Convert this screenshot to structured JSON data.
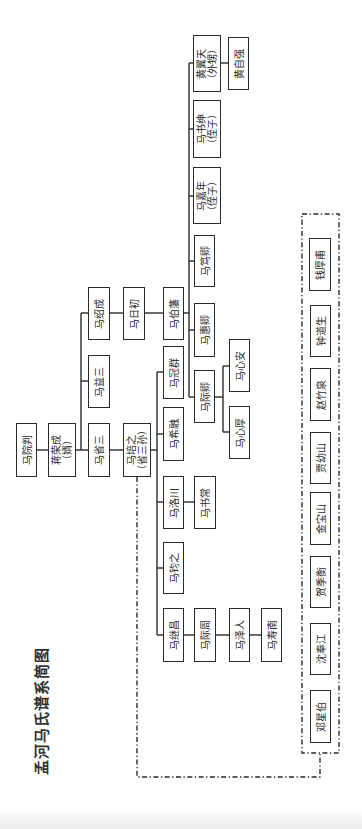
{
  "title": "孟河马氏谱系简图",
  "colors": {
    "line": "#2a2a2a",
    "text": "#2a2a2a",
    "background": "#ffffff"
  },
  "nodes": {
    "ma_yuanpan": {
      "name": "马院判"
    },
    "jiang_rongcheng": {
      "name": "蒋荣成",
      "note": "（婿）"
    },
    "ma_shaocheng": {
      "name": "马绍成"
    },
    "ma_yisan": {
      "name": "马益三"
    },
    "ma_shengsan": {
      "name": "马省三"
    },
    "ma_richu": {
      "name": "马日初"
    },
    "ma_bofan": {
      "name": "马伯藩"
    },
    "huang_yitian": {
      "name": "黄翼天",
      "note": "（外甥）"
    },
    "huang_ziqiang": {
      "name": "黄自强"
    },
    "ma_shushen": {
      "name": "马书绅",
      "note": "（侄子）"
    },
    "ma_jianian": {
      "name": "马嘉年",
      "note": "（侄子）"
    },
    "ma_duqing": {
      "name": "马笃卿"
    },
    "ma_huiqing": {
      "name": "马惠卿"
    },
    "ma_jiqing": {
      "name": "马际卿"
    },
    "ma_xinan": {
      "name": "马心安"
    },
    "ma_xinhou": {
      "name": "马心厚"
    },
    "ma_peizhi": {
      "name": "马培之",
      "note": "（省三孙）"
    },
    "ma_guanqun": {
      "name": "马冠群"
    },
    "ma_xirong": {
      "name": "马希融"
    },
    "ma_luochuan": {
      "name": "马洛川"
    },
    "ma_shuchang": {
      "name": "马书常"
    },
    "ma_junzhi": {
      "name": "马钧之"
    },
    "ma_jichang": {
      "name": "马继昌"
    },
    "ma_jizhou": {
      "name": "马际周"
    },
    "ma_zeren": {
      "name": "马泽人"
    },
    "ma_shounan": {
      "name": "马寿南"
    }
  },
  "students": [
    "钱厚甫",
    "钟道生",
    "赵竹泉",
    "贾幼山",
    "金宝山",
    "贺季衡",
    "沈奉江",
    "邓星伯"
  ],
  "edges": [
    [
      "马院判",
      "蒋荣成"
    ],
    [
      "蒋荣成",
      "马绍成"
    ],
    [
      "蒋荣成",
      "马益三"
    ],
    [
      "蒋荣成",
      "马省三"
    ],
    [
      "马绍成",
      "马日初"
    ],
    [
      "马日初",
      "马伯藩"
    ],
    [
      "马伯藩",
      "黄翼天"
    ],
    [
      "马伯藩",
      "马书绅"
    ],
    [
      "马伯藩",
      "马嘉年"
    ],
    [
      "马伯藩",
      "马笃卿"
    ],
    [
      "马伯藩",
      "马惠卿"
    ],
    [
      "马伯藩",
      "马际卿"
    ],
    [
      "黄翼天",
      "黄自强"
    ],
    [
      "马际卿",
      "马心安"
    ],
    [
      "马际卿",
      "马心厚"
    ],
    [
      "马省三",
      "马培之"
    ],
    [
      "马培之",
      "马冠群"
    ],
    [
      "马培之",
      "马希融"
    ],
    [
      "马培之",
      "马洛川"
    ],
    [
      "马培之",
      "马钧之"
    ],
    [
      "马培之",
      "马继昌"
    ],
    [
      "马洛川",
      "马书常"
    ],
    [
      "马继昌",
      "马际周"
    ],
    [
      "马际周",
      "马泽人"
    ],
    [
      "马泽人",
      "马寿南"
    ]
  ],
  "dashed_links": [
    [
      "马培之",
      "students"
    ]
  ]
}
